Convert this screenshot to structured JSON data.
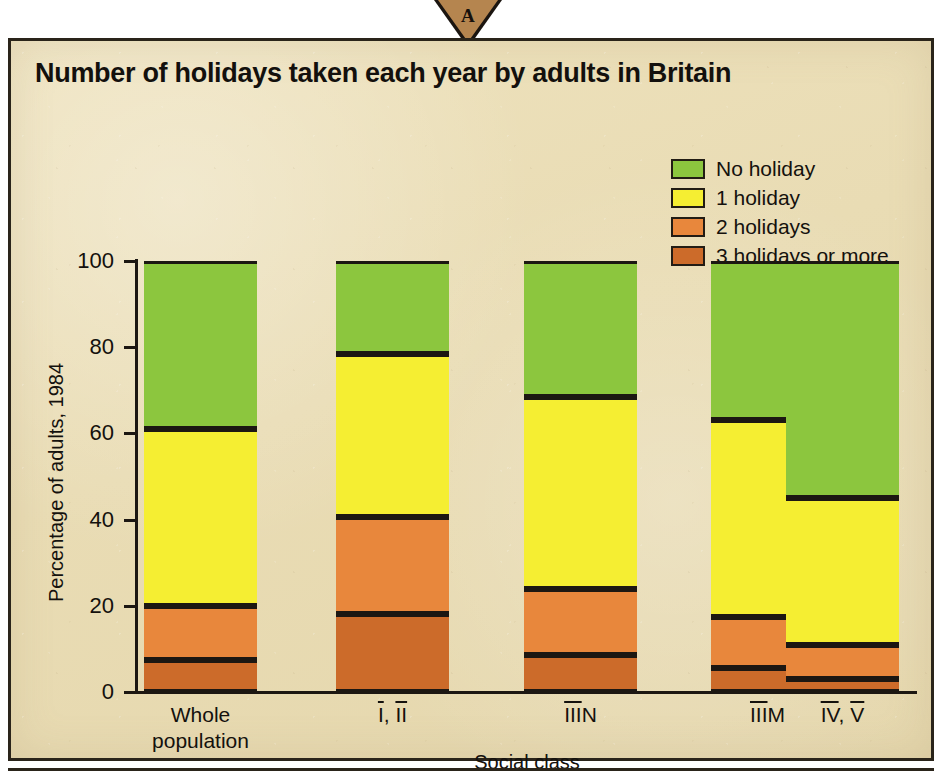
{
  "marker": {
    "letter": "A",
    "color": "#b5854f"
  },
  "chart": {
    "title": "Number of holidays taken each year by adults in Britain",
    "y_axis_title": "Percentage of adults, 1984",
    "x_axis_title": "Social class"
  },
  "legend": {
    "items": [
      {
        "label": "No holiday",
        "color": "#8cc63e"
      },
      {
        "label": "1 holiday",
        "color": "#f5ee32"
      },
      {
        "label": "2 holidays",
        "color": "#e8873c"
      },
      {
        "label": "3 holidays or more",
        "color": "#cc6b2a"
      }
    ]
  },
  "chart_data": {
    "type": "bar",
    "subtype": "stacked",
    "title": "Number of holidays taken each year by adults in Britain",
    "xlabel": "Social class",
    "ylabel": "Percentage of adults, 1984",
    "ylim": [
      0,
      100
    ],
    "yticks": [
      0,
      20,
      40,
      60,
      80,
      100
    ],
    "grid": false,
    "legend_position": "top-right",
    "categories": [
      "Whole population",
      "Ⅰ, Ⅱ",
      "ⅢN",
      "ⅢM",
      "Ⅳ, Ⅴ"
    ],
    "category_lines": [
      [
        "Whole",
        "population"
      ],
      [
        "I, II"
      ],
      [
        "IIIN"
      ],
      [
        "IIIM"
      ],
      [
        "IV, V"
      ]
    ],
    "series": [
      {
        "name": "3 holidays or more",
        "color": "#cc6b2a",
        "values": [
          7.5,
          18,
          8.5,
          5.5,
          3
        ]
      },
      {
        "name": "2 holidays",
        "color": "#e8873c",
        "values": [
          12.5,
          22.5,
          15.5,
          12,
          8
        ]
      },
      {
        "name": "1 holiday",
        "color": "#f5ee32",
        "values": [
          41,
          38,
          44.5,
          45.5,
          34
        ]
      },
      {
        "name": "No holiday",
        "color": "#8cc63e",
        "values": [
          39,
          21.5,
          31.5,
          37,
          55
        ]
      }
    ],
    "cumulative_tops": [
      {
        "category": "Whole population",
        "3_holidays_or_more": 7.5,
        "2_holidays": 20,
        "1_holiday": 61,
        "no_holiday": 100
      },
      {
        "category": "Ⅰ, Ⅱ",
        "3_holidays_or_more": 18,
        "2_holidays": 40.5,
        "1_holiday": 78.5,
        "no_holiday": 100
      },
      {
        "category": "ⅢN",
        "3_holidays_or_more": 8.5,
        "2_holidays": 24,
        "1_holiday": 68.5,
        "no_holiday": 100
      },
      {
        "category": "ⅢM",
        "3_holidays_or_more": 5.5,
        "2_holidays": 17.5,
        "1_holiday": 63,
        "no_holiday": 100
      },
      {
        "category": "Ⅳ, Ⅴ",
        "3_holidays_or_more": 3,
        "2_holidays": 11,
        "1_holiday": 45,
        "no_holiday": 100
      }
    ]
  },
  "colors": {
    "background": "#e9dcb4",
    "ink": "#1c1712",
    "green": "#8cc63e",
    "yellow": "#f5ee32",
    "orange_light": "#e8873c",
    "orange_dark": "#cc6b2a"
  }
}
